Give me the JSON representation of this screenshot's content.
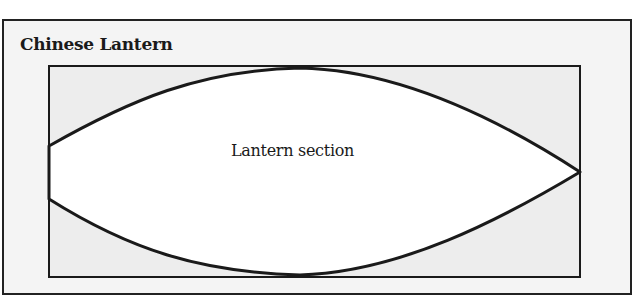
{
  "panel": {
    "title": "Chinese Lantern"
  },
  "diagram": {
    "shape_label": "Lantern section",
    "colors": {
      "panel_bg": "#f4f4f4",
      "rect_fill": "#ededed",
      "lantern_fill": "#ffffff",
      "stroke": "#1a1a1a"
    }
  }
}
